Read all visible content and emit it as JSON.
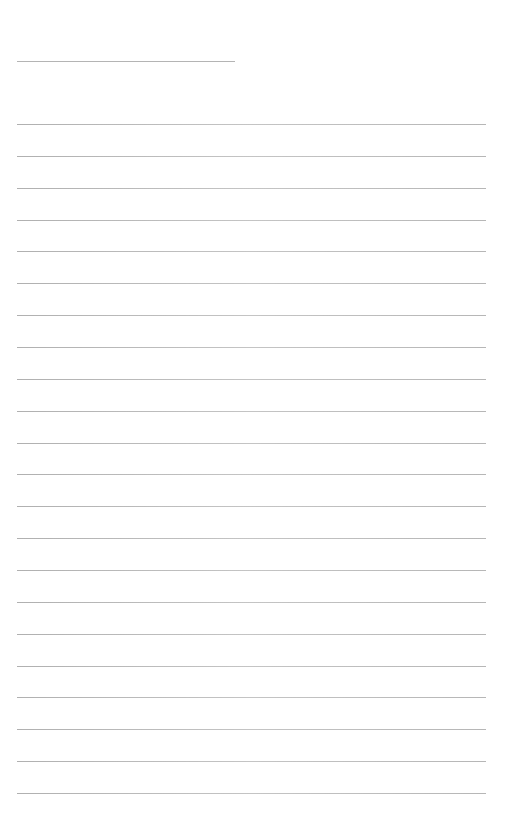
{
  "page": {
    "type": "lined-paper",
    "background_color": "#ffffff",
    "line_color": "#b4b4b4",
    "header_line": {
      "x": 17,
      "y": 61,
      "width": 218
    },
    "rules": {
      "count": 22,
      "x": 17,
      "width": 469,
      "first_y": 124,
      "spacing": 31.86
    }
  }
}
